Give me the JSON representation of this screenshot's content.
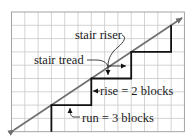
{
  "diagram": {
    "grid": {
      "x0": 11.5,
      "y0": 12,
      "cell": 13.3,
      "cols": 13,
      "rows": 9,
      "color": "#c9c9c9",
      "border": "#9a9a9a"
    },
    "line": {
      "color": "#6e6e6e"
    },
    "stairs": {
      "color": "#111111"
    },
    "labels": {
      "riser": "stair riser",
      "tread": "stair tread",
      "rise": "rise = 2 blocks",
      "run": "run = 3 blocks"
    }
  }
}
